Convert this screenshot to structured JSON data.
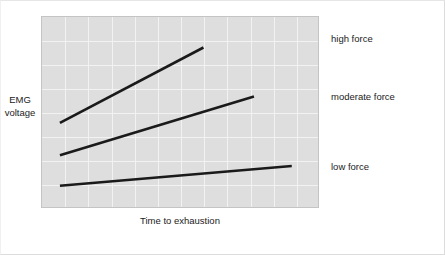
{
  "figure": {
    "background_color": "#ffffff",
    "panel_color": "#dedede",
    "grid_color": "#f2f2f2",
    "line_color": "#1a1a1a"
  },
  "axes": {
    "y_title_line1": "EMG",
    "y_title_line2": "voltage",
    "x_title": "Time to exhaustion"
  },
  "labels": {
    "high": "high force",
    "moderate": "moderate force",
    "low": "low force"
  },
  "chart_data": {
    "type": "line",
    "title": "",
    "xlabel": "Time to exhaustion",
    "ylabel": "EMG voltage",
    "xlim": [
      0,
      1
    ],
    "ylim": [
      0,
      1
    ],
    "grid": true,
    "axis_ticks": false,
    "legend_position": "right-inline",
    "grid_columns": 12,
    "grid_rows": 8,
    "series": [
      {
        "name": "high force",
        "label": "high force",
        "color": "#1a1a1a",
        "description": "Steepest slope: EMG voltage rises quickly and reaches exhaustion soonest.",
        "points": [
          {
            "x": 0.065,
            "y": 0.445
          },
          {
            "x": 0.585,
            "y": 0.84
          }
        ]
      },
      {
        "name": "moderate force",
        "label": "moderate force",
        "color": "#1a1a1a",
        "description": "Intermediate slope: EMG voltage rises moderately over a longer time.",
        "points": [
          {
            "x": 0.065,
            "y": 0.275
          },
          {
            "x": 0.768,
            "y": 0.583
          }
        ]
      },
      {
        "name": "low force",
        "label": "low force",
        "color": "#1a1a1a",
        "description": "Shallowest slope: EMG voltage rises slowly over the longest time to exhaustion.",
        "points": [
          {
            "x": 0.065,
            "y": 0.115
          },
          {
            "x": 0.905,
            "y": 0.218
          }
        ]
      }
    ]
  }
}
